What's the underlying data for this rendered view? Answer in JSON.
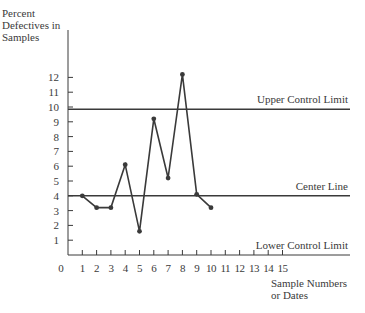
{
  "chart_data": {
    "type": "line",
    "title": "",
    "ylabel": "Percent Defectives in Samples",
    "ylabel_lines": [
      "Percent",
      "Defectives in",
      "Samples"
    ],
    "xlabel": "Sample Numbers or Dates",
    "xlabel_lines": [
      "Sample Numbers",
      "or Dates"
    ],
    "x_ticks": [
      0,
      1,
      2,
      3,
      4,
      5,
      6,
      7,
      8,
      9,
      10,
      11,
      12,
      13,
      14,
      15
    ],
    "y_ticks": [
      1,
      2,
      3,
      4,
      5,
      6,
      7,
      8,
      9,
      10,
      11,
      12
    ],
    "origin_label": "0",
    "xlim": [
      0,
      20
    ],
    "ylim": [
      0,
      15
    ],
    "grid": false,
    "series": [
      {
        "name": "Sample percent defective",
        "x": [
          1,
          2,
          3,
          4,
          5,
          6,
          7,
          8,
          9,
          10
        ],
        "values": [
          4.0,
          3.2,
          3.2,
          6.1,
          1.6,
          9.2,
          5.2,
          12.2,
          4.1,
          3.2
        ]
      }
    ],
    "reference_lines": [
      {
        "name": "Upper Control Limit",
        "value": 9.85
      },
      {
        "name": "Center Line",
        "value": 4.0
      },
      {
        "name": "Lower Control Limit",
        "value": 0
      }
    ],
    "colors": {
      "ink": "#3a3a3a",
      "background": "#ffffff"
    }
  }
}
